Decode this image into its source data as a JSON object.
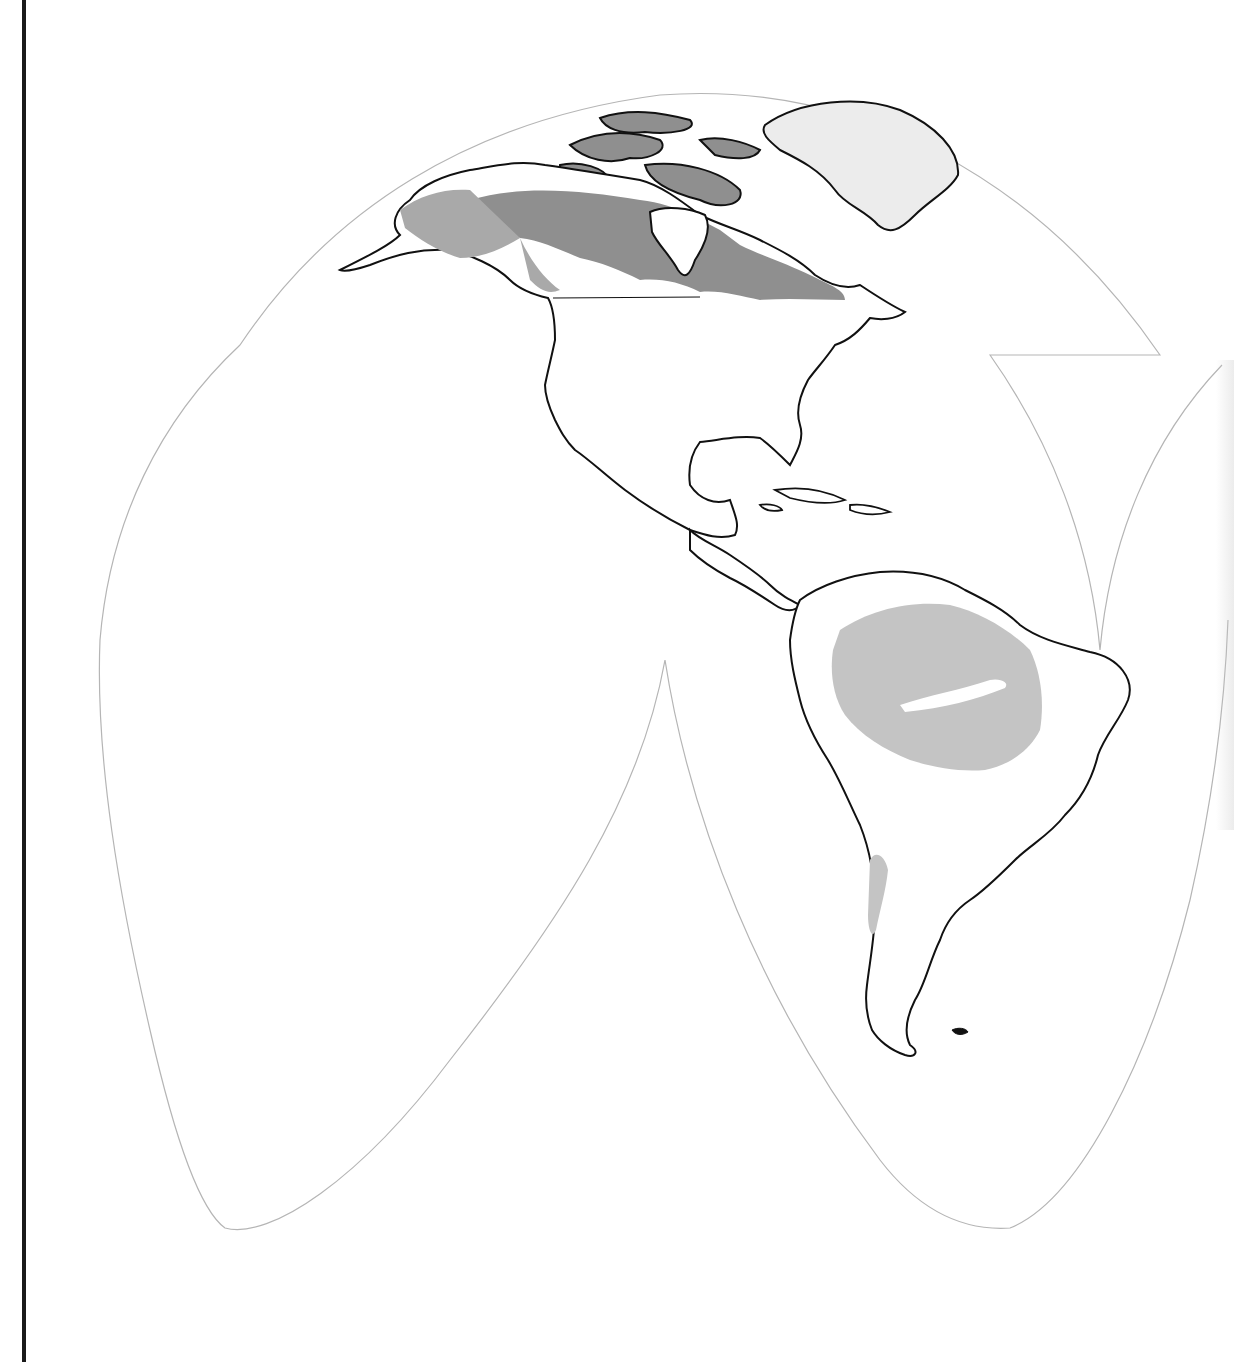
{
  "map": {
    "type": "interrupted-projection-world-map",
    "region_shown": "Americas",
    "labels": [],
    "colors": {
      "background": "#ffffff",
      "projection_outline": "#b5b5b5",
      "coastline": "#111111",
      "dark_forest": "#8f8f8f",
      "medium_forest": "#a9a9a9",
      "light_forest": "#c4c4c4",
      "greenland": "#ececec",
      "left_rule": "#1a1a1a"
    },
    "legend": null
  }
}
